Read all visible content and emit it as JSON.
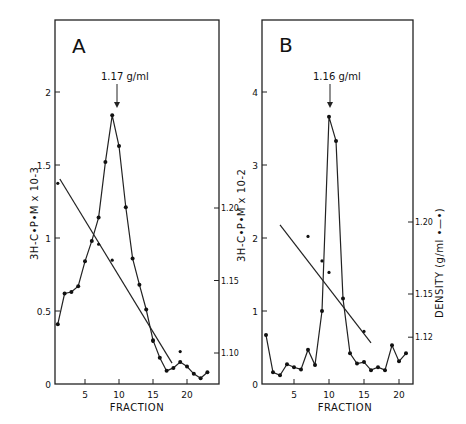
{
  "chart_data": [
    {
      "type": "line",
      "panel": "A",
      "annotation": "1.17 g/ml",
      "xlabel": "FRACTION",
      "ylabel": "3H-C•P•M x 10-3",
      "y2label": "",
      "xticks": [
        "5",
        "10",
        "15",
        "20"
      ],
      "yticks": [
        "0",
        "0.5",
        "1",
        "1.5",
        "2"
      ],
      "y2ticks": [
        "1.10",
        "1.15",
        "1.20"
      ],
      "xlim": [
        0,
        24
      ],
      "ylim": [
        0,
        2.5
      ],
      "series": [
        {
          "name": "3H-CPM",
          "x": [
            1,
            2,
            3,
            4,
            5,
            6,
            7,
            8,
            9,
            10,
            11,
            12,
            13,
            14,
            15,
            16,
            17,
            18,
            19,
            20,
            21,
            22,
            23
          ],
          "y": [
            0.41,
            0.62,
            0.63,
            0.67,
            0.84,
            0.98,
            1.14,
            1.52,
            1.84,
            1.63,
            1.21,
            0.86,
            0.68,
            0.51,
            0.3,
            0.18,
            0.09,
            0.11,
            0.15,
            0.12,
            0.07,
            0.04,
            0.08
          ]
        },
        {
          "name": "Density (g/ml)",
          "x": [
            1,
            7,
            9,
            15,
            19
          ],
          "y": [
            1.217,
            1.175,
            1.164,
            1.108,
            1.101
          ],
          "fit_line": {
            "x": [
              1.3,
              17.8
            ],
            "y": [
              1.22,
              1.093
            ]
          }
        }
      ],
      "grid": false
    },
    {
      "type": "line",
      "panel": "B",
      "annotation": "1.16 g/ml",
      "xlabel": "FRACTION",
      "ylabel": "3H-C•P•M x 10-2",
      "y2label": "DENSITY (g/ml •—•)",
      "xticks": [
        "5",
        "10",
        "15",
        "20"
      ],
      "yticks": [
        "0",
        "1",
        "2",
        "3",
        "4"
      ],
      "y2ticks": [
        "1.12",
        "1.15",
        "1.20"
      ],
      "xlim": [
        0,
        22
      ],
      "ylim": [
        0,
        5
      ],
      "series": [
        {
          "name": "3H-CPM",
          "x": [
            1,
            2,
            3,
            4,
            5,
            6,
            7,
            8,
            9,
            10,
            11,
            12,
            13,
            14,
            15,
            16,
            17,
            18,
            19,
            20,
            21
          ],
          "y": [
            0.67,
            0.16,
            0.12,
            0.27,
            0.23,
            0.2,
            0.47,
            0.26,
            1.0,
            3.66,
            3.33,
            1.17,
            0.42,
            0.28,
            0.3,
            0.19,
            0.23,
            0.19,
            0.53,
            0.31,
            0.42
          ]
        },
        {
          "name": "Density (g/ml)",
          "x": [
            7,
            9,
            10,
            15
          ],
          "y": [
            1.19,
            1.173,
            1.165,
            1.124
          ],
          "fit_line": {
            "x": [
              3,
              16
            ],
            "y": [
              1.198,
              1.116
            ]
          }
        }
      ],
      "grid": false
    }
  ]
}
